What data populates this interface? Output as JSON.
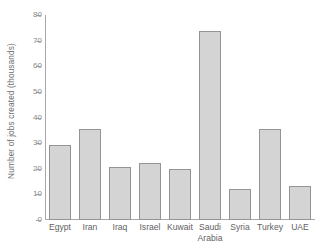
{
  "chart_data": {
    "type": "bar",
    "title": "",
    "xlabel": "",
    "ylabel": "Number of jobs created (thousands)",
    "ylim": [
      0,
      80
    ],
    "ytick_labels": [
      "80",
      "70",
      "60",
      "50",
      "40",
      "30",
      "20",
      "10",
      "0"
    ],
    "yticks": [
      80,
      70,
      60,
      50,
      40,
      30,
      20,
      10,
      0
    ],
    "grid": false,
    "legend": null,
    "categories": [
      "Egypt",
      "Iran",
      "Iraq",
      "Israel",
      "Kuwait",
      "Saudi Arabia",
      "Syria",
      "Turkey",
      "UAE"
    ],
    "category_lines": [
      [
        "Egypt"
      ],
      [
        "Iran"
      ],
      [
        "Iraq"
      ],
      [
        "Israel"
      ],
      [
        "Kuwait"
      ],
      [
        "Saudi",
        "Arabia"
      ],
      [
        "Syria"
      ],
      [
        "Turkey"
      ],
      [
        "UAE"
      ]
    ],
    "values": [
      29.1,
      35.4,
      20.5,
      22.4,
      20.1,
      73.6,
      12.2,
      35.4,
      13.4
    ],
    "bar_color": "#d4d4d4",
    "bar_border_color": "#949494",
    "axis_color": "#a8a8a8",
    "text_color": "#5f5f5f"
  }
}
